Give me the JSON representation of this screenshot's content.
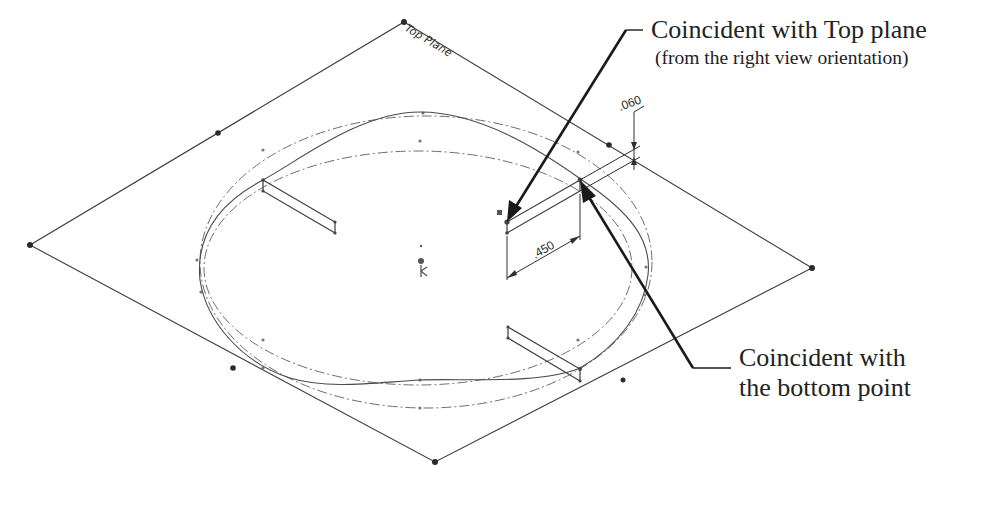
{
  "diagram": {
    "plane_label": "Top Plane",
    "dimensions": {
      "horizontal": ".450",
      "vertical": ".060"
    },
    "callouts": [
      {
        "id": "top-plane",
        "title": "Coincident with Top plane",
        "subtitle": "(from the right view orientation)"
      },
      {
        "id": "bottom-point",
        "line1": "Coincident with",
        "line2": "the bottom point"
      }
    ],
    "colors": {
      "line": "#3a3a3a",
      "leader": "#1a1a1a",
      "text": "#222222",
      "background": "#ffffff"
    }
  }
}
